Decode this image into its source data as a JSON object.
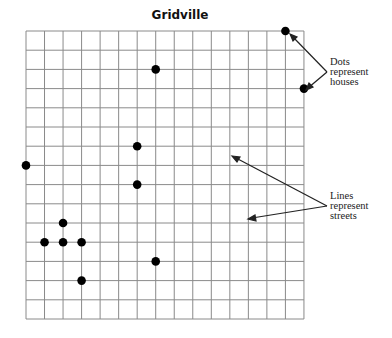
{
  "title": "Gridville",
  "grid": {
    "left": 26,
    "top": 31,
    "cols": 15,
    "rows": 15,
    "col_w": 18.53,
    "row_h": 19.2,
    "line_color": "#8a8a8a"
  },
  "houses": [
    {
      "col": 14,
      "row": 0
    },
    {
      "col": 7,
      "row": 2
    },
    {
      "col": 15,
      "row": 3
    },
    {
      "col": 6,
      "row": 6
    },
    {
      "col": 0,
      "row": 7
    },
    {
      "col": 6,
      "row": 8
    },
    {
      "col": 2,
      "row": 10
    },
    {
      "col": 1,
      "row": 11
    },
    {
      "col": 2,
      "row": 11
    },
    {
      "col": 3,
      "row": 11
    },
    {
      "col": 7,
      "row": 12
    },
    {
      "col": 3,
      "row": 13
    }
  ],
  "legend": {
    "dots": {
      "line1": "Dots",
      "line2": "represent",
      "line3": "houses"
    },
    "lines": {
      "line1": "Lines",
      "line2": "represent",
      "line3": "streets"
    }
  }
}
